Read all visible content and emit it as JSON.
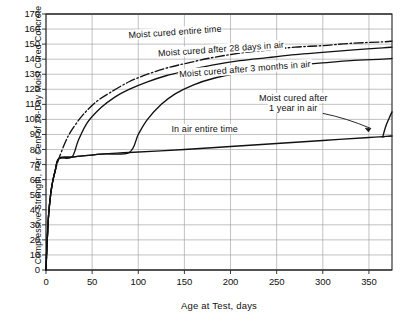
{
  "chart_data": {
    "type": "line",
    "title": "",
    "xlabel": "Age at Test, days",
    "ylabel": "Compressive Strength, Per Cent of 28-Day Moist Cured Concrete",
    "xlim": [
      0,
      375
    ],
    "ylim": [
      0,
      170
    ],
    "xticks": [
      0,
      50,
      100,
      150,
      200,
      250,
      300,
      350
    ],
    "yticks": [
      0,
      10,
      20,
      30,
      40,
      50,
      60,
      70,
      80,
      90,
      100,
      110,
      120,
      130,
      140,
      150,
      160,
      170
    ],
    "grid": true,
    "legend_position": "inline-annotations",
    "series": [
      {
        "name": "Moist cured entire time",
        "style": "dash-dot",
        "points": [
          [
            0,
            0
          ],
          [
            1,
            16
          ],
          [
            2,
            28
          ],
          [
            3,
            38
          ],
          [
            5,
            50
          ],
          [
            7,
            58
          ],
          [
            10,
            66
          ],
          [
            14,
            74
          ],
          [
            21,
            85
          ],
          [
            28,
            93
          ],
          [
            40,
            103
          ],
          [
            55,
            112
          ],
          [
            70,
            118
          ],
          [
            90,
            125
          ],
          [
            110,
            130
          ],
          [
            130,
            134
          ],
          [
            150,
            137
          ],
          [
            180,
            141
          ],
          [
            210,
            144
          ],
          [
            240,
            146
          ],
          [
            270,
            148
          ],
          [
            300,
            149
          ],
          [
            330,
            150.5
          ],
          [
            365,
            151.5
          ],
          [
            375,
            152
          ]
        ]
      },
      {
        "name": "Moist cured after 28 days in air",
        "style": "solid",
        "points": [
          [
            0,
            0
          ],
          [
            1,
            16
          ],
          [
            2,
            28
          ],
          [
            3,
            38
          ],
          [
            5,
            50
          ],
          [
            7,
            58
          ],
          [
            10,
            66
          ],
          [
            14,
            74
          ],
          [
            28,
            75
          ],
          [
            35,
            86
          ],
          [
            45,
            98
          ],
          [
            60,
            108
          ],
          [
            75,
            115
          ],
          [
            90,
            120
          ],
          [
            110,
            125
          ],
          [
            130,
            129
          ],
          [
            150,
            132
          ],
          [
            180,
            136
          ],
          [
            210,
            139
          ],
          [
            240,
            141
          ],
          [
            270,
            143
          ],
          [
            300,
            144.5
          ],
          [
            330,
            146
          ],
          [
            365,
            147.5
          ],
          [
            375,
            148
          ]
        ]
      },
      {
        "name": "Moist cured after 3 months in air",
        "style": "solid",
        "points": [
          [
            0,
            0
          ],
          [
            1,
            16
          ],
          [
            2,
            28
          ],
          [
            3,
            38
          ],
          [
            5,
            50
          ],
          [
            7,
            58
          ],
          [
            10,
            66
          ],
          [
            14,
            74
          ],
          [
            28,
            75
          ],
          [
            60,
            77
          ],
          [
            90,
            78
          ],
          [
            100,
            90
          ],
          [
            110,
            100
          ],
          [
            125,
            110
          ],
          [
            140,
            117
          ],
          [
            160,
            123
          ],
          [
            180,
            127
          ],
          [
            210,
            131
          ],
          [
            240,
            134
          ],
          [
            270,
            136
          ],
          [
            300,
            137.5
          ],
          [
            330,
            139
          ],
          [
            365,
            140
          ],
          [
            375,
            140.5
          ]
        ]
      },
      {
        "name": "In air entire time",
        "style": "solid",
        "points": [
          [
            0,
            0
          ],
          [
            1,
            16
          ],
          [
            2,
            28
          ],
          [
            3,
            38
          ],
          [
            5,
            50
          ],
          [
            7,
            58
          ],
          [
            10,
            66
          ],
          [
            14,
            74
          ],
          [
            28,
            75
          ],
          [
            60,
            77
          ],
          [
            90,
            78
          ],
          [
            150,
            80
          ],
          [
            200,
            82
          ],
          [
            250,
            84
          ],
          [
            300,
            86
          ],
          [
            350,
            88
          ],
          [
            365,
            88.5
          ],
          [
            375,
            89
          ]
        ]
      },
      {
        "name": "Moist cured after 1 year in air",
        "style": "solid-branch",
        "points": [
          [
            365,
            88.5
          ],
          [
            368,
            95
          ],
          [
            372,
            101
          ],
          [
            375,
            105
          ]
        ]
      },
      {
        "name": "In air entire time continuation",
        "style": "dashed-short",
        "points": [
          [
            365,
            88.5
          ],
          [
            375,
            89
          ]
        ]
      }
    ],
    "annotations": [
      {
        "text": "Moist cured entire time",
        "x": 140,
        "y": 157
      },
      {
        "text": "Moist cured after 28 days in air",
        "x": 190,
        "y": 145
      },
      {
        "text": "Moist cured after 3 months in air",
        "x": 215,
        "y": 132
      },
      {
        "text": "Moist cured after",
        "x": 270,
        "y": 112
      },
      {
        "text": "1 year in air",
        "x": 270,
        "y": 105
      },
      {
        "text": "In air entire time",
        "x": 175,
        "y": 92
      }
    ]
  },
  "axes": {
    "x_title": "Age at Test, days",
    "y_title": "Compressive Strength, Per Cent of 28-Day Moist Cured Concrete",
    "x_tick_labels": [
      "0",
      "50",
      "100",
      "150",
      "200",
      "250",
      "300",
      "350"
    ],
    "y_tick_labels": [
      "0",
      "10",
      "20",
      "30",
      "40",
      "50",
      "60",
      "70",
      "80",
      "90",
      "100",
      "110",
      "120",
      "130",
      "140",
      "150",
      "160",
      "170"
    ]
  },
  "labels": {
    "moist_entire": "Moist cured entire time",
    "moist_28days": "Moist cured after 28 days in air",
    "moist_3months": "Moist cured after 3 months in air",
    "moist_1year_line1": "Moist cured after",
    "moist_1year_line2": "1 year in air",
    "in_air_entire": "In air entire time"
  },
  "colors": {
    "curve": "#111111",
    "grid": "#999999",
    "axis": "#222222",
    "background": "#ffffff"
  }
}
